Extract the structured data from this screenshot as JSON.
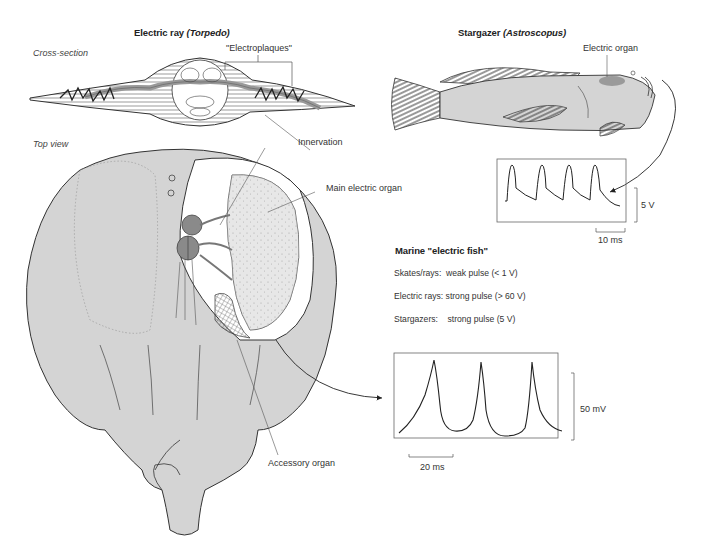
{
  "diagram": {
    "left_panel": {
      "title_main": "Electric ray ",
      "title_genus": "(Torpedo)",
      "cross_section_label": "Cross-section",
      "electroplaques_label": "\"Electroplaques\"",
      "top_view_label": "Top view",
      "innervation_label": "Innervation",
      "main_organ_label": "Main electric organ",
      "accessory_organ_label": "Accessory organ"
    },
    "right_panel": {
      "title_main": "Stargazer ",
      "title_genus": "(Astroscopus)",
      "electric_organ_label": "Electric organ",
      "stargazer_trace": {
        "voltage_scale": "5 V",
        "time_scale": "10 ms",
        "pulse_count": 4
      },
      "marine_fish": {
        "heading": "Marine \"electric fish\"",
        "items": [
          {
            "group": "Skates/rays:",
            "desc": "weak pulse (< 1 V)"
          },
          {
            "group": "Electric rays:",
            "desc": "strong pulse (> 60 V)"
          },
          {
            "group": "Stargazers:",
            "desc": "strong pulse (5 V)"
          }
        ]
      },
      "ray_trace": {
        "voltage_scale": "50 mV",
        "time_scale": "20 ms",
        "pulse_count": 3
      }
    },
    "colors": {
      "body_fill": "#d4d4d4",
      "organ_dark": "#8a8a8a",
      "outline": "#333333",
      "stargazer_organ": "#9a9a9a"
    }
  }
}
